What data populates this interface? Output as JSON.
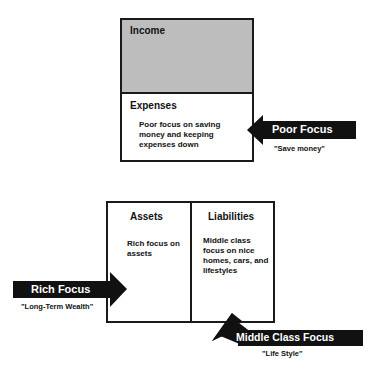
{
  "income_statement": {
    "income_label": "Income",
    "expenses_label": "Expenses",
    "expenses_text": "Poor focus on saving money and keeping expenses down",
    "income_fill_color": "#bdbdbd"
  },
  "balance_sheet": {
    "assets_label": "Assets",
    "assets_text": "Rich focus on assets",
    "liabilities_label": "Liabilities",
    "liabilities_text": "Middle class focus on nice homes, cars, and lifestyles"
  },
  "arrows": {
    "poor": {
      "label": "Poor Focus",
      "caption": "\"Save money\""
    },
    "rich": {
      "label": "Rich Focus",
      "caption": "\"Long-Term Wealth\""
    },
    "middle": {
      "label": "Middle Class Focus",
      "caption": "\"Life Style\""
    }
  }
}
